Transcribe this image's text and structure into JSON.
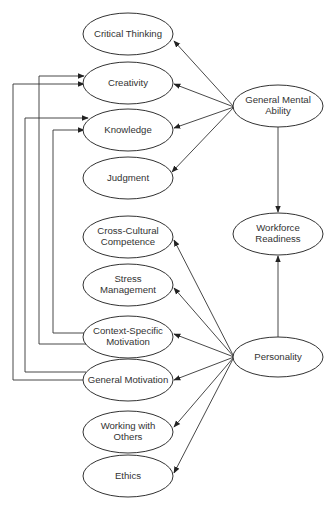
{
  "diagram": {
    "nodes": [
      {
        "id": "critical_thinking",
        "lines": [
          "Critical Thinking"
        ],
        "cx": 128,
        "cy": 34,
        "rx": 45,
        "ry": 21
      },
      {
        "id": "creativity",
        "lines": [
          "Creativity"
        ],
        "cx": 128,
        "cy": 83,
        "rx": 45,
        "ry": 21
      },
      {
        "id": "knowledge",
        "lines": [
          "Knowledge"
        ],
        "cx": 128,
        "cy": 130,
        "rx": 45,
        "ry": 21
      },
      {
        "id": "judgment",
        "lines": [
          "Judgment"
        ],
        "cx": 128,
        "cy": 178,
        "rx": 45,
        "ry": 21
      },
      {
        "id": "cross_cultural",
        "lines": [
          "Cross-Cultural",
          "Competence"
        ],
        "cx": 128,
        "cy": 237,
        "rx": 45,
        "ry": 21
      },
      {
        "id": "stress_management",
        "lines": [
          "Stress",
          "Management"
        ],
        "cx": 128,
        "cy": 285,
        "rx": 45,
        "ry": 21
      },
      {
        "id": "context_specific_motivation",
        "lines": [
          "Context-Specific",
          "Motivation"
        ],
        "cx": 128,
        "cy": 337,
        "rx": 45,
        "ry": 21
      },
      {
        "id": "general_motivation",
        "lines": [
          "General Motivation"
        ],
        "cx": 128,
        "cy": 380,
        "rx": 45,
        "ry": 21
      },
      {
        "id": "working_with_others",
        "lines": [
          "Working with",
          "Others"
        ],
        "cx": 128,
        "cy": 432,
        "rx": 45,
        "ry": 21
      },
      {
        "id": "ethics",
        "lines": [
          "Ethics"
        ],
        "cx": 128,
        "cy": 476,
        "rx": 45,
        "ry": 21
      },
      {
        "id": "general_mental_ability",
        "lines": [
          "General Mental",
          "Ability"
        ],
        "cx": 278,
        "cy": 106,
        "rx": 45,
        "ry": 21
      },
      {
        "id": "workforce_readiness",
        "lines": [
          "Workforce",
          "Readiness"
        ],
        "cx": 278,
        "cy": 234,
        "rx": 45,
        "ry": 21
      },
      {
        "id": "personality",
        "lines": [
          "Personality"
        ],
        "cx": 278,
        "cy": 357,
        "rx": 45,
        "ry": 20
      }
    ],
    "edges": [
      {
        "from": "general_mental_ability",
        "to": "critical_thinking",
        "points": [
          [
            234,
            107
          ],
          [
            174,
            41
          ]
        ]
      },
      {
        "from": "general_mental_ability",
        "to": "creativity",
        "points": [
          [
            234,
            107
          ],
          [
            174,
            84
          ]
        ]
      },
      {
        "from": "general_mental_ability",
        "to": "knowledge",
        "points": [
          [
            234,
            107
          ],
          [
            174,
            128
          ]
        ]
      },
      {
        "from": "general_mental_ability",
        "to": "judgment",
        "points": [
          [
            234,
            107
          ],
          [
            172,
            172
          ]
        ]
      },
      {
        "from": "general_mental_ability",
        "to": "workforce_readiness",
        "points": [
          [
            278,
            127
          ],
          [
            278,
            212
          ]
        ]
      },
      {
        "from": "personality",
        "to": "workforce_readiness",
        "points": [
          [
            278,
            337
          ],
          [
            278,
            256
          ]
        ]
      },
      {
        "from": "personality",
        "to": "cross_cultural",
        "points": [
          [
            234,
            357
          ],
          [
            174,
            240
          ]
        ]
      },
      {
        "from": "personality",
        "to": "stress_management",
        "points": [
          [
            234,
            357
          ],
          [
            174,
            288
          ]
        ]
      },
      {
        "from": "personality",
        "to": "context_specific_motivation",
        "points": [
          [
            234,
            357
          ],
          [
            174,
            334
          ]
        ]
      },
      {
        "from": "personality",
        "to": "general_motivation",
        "points": [
          [
            234,
            357
          ],
          [
            174,
            380
          ]
        ]
      },
      {
        "from": "personality",
        "to": "working_with_others",
        "points": [
          [
            234,
            357
          ],
          [
            174,
            427
          ]
        ]
      },
      {
        "from": "personality",
        "to": "ethics",
        "points": [
          [
            234,
            357
          ],
          [
            174,
            473
          ]
        ]
      },
      {
        "from": "context_specific_motivation",
        "to": "creativity",
        "points": [
          [
            86,
            344
          ],
          [
            39,
            344
          ],
          [
            39,
            76
          ],
          [
            84,
            76
          ]
        ]
      },
      {
        "from": "context_specific_motivation",
        "to": "knowledge",
        "points": [
          [
            84,
            333
          ],
          [
            53,
            333
          ],
          [
            53,
            130
          ],
          [
            84,
            130
          ]
        ]
      },
      {
        "from": "general_motivation",
        "to": "creativity",
        "points": [
          [
            84,
            380
          ],
          [
            13,
            380
          ],
          [
            13,
            84
          ],
          [
            84,
            84
          ]
        ]
      },
      {
        "from": "general_motivation",
        "to": "knowledge",
        "points": [
          [
            86,
            372
          ],
          [
            25,
            372
          ],
          [
            25,
            118
          ],
          [
            88,
            118
          ]
        ]
      }
    ],
    "colors": {
      "stroke": "#333333",
      "fill": "#ffffff",
      "text": "#333333"
    }
  }
}
